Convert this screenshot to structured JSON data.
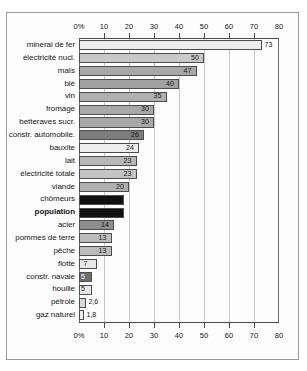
{
  "chart_data": {
    "type": "bar",
    "orientation": "horizontal",
    "title": "",
    "xlabel": "",
    "ylabel": "",
    "xlim": [
      0,
      80
    ],
    "xticks": [
      0,
      10,
      20,
      30,
      40,
      50,
      60,
      70,
      80
    ],
    "xtick_labels": [
      "0%",
      "10",
      "20",
      "30",
      "40",
      "50",
      "60",
      "70",
      "80"
    ],
    "grid": true,
    "grid_axis": "x",
    "axis_positions": [
      "top",
      "bottom"
    ],
    "legend": null,
    "categories": [
      "minerai de fer",
      "électricité nucl.",
      "maïs",
      "blé",
      "vin",
      "fromage",
      "betteraves sucr.",
      "constr. automobile.",
      "bauxite",
      "lait",
      "électricité totale",
      "viande",
      "chômeurs",
      "population",
      "acier",
      "pommes de terre",
      "pêche",
      "flotte",
      "constr. navale",
      "houille",
      "pétrole",
      "gaz naturel"
    ],
    "values": [
      73,
      50,
      47,
      40,
      35,
      30,
      30,
      26,
      24,
      23,
      23,
      20,
      18,
      18,
      14,
      13,
      13,
      7,
      5,
      5,
      2.6,
      1.8
    ],
    "value_labels": [
      "73",
      "50",
      "47",
      "40",
      "35",
      "30",
      "30",
      "26",
      "24",
      "23",
      "23",
      "20",
      "",
      "",
      "14",
      "13",
      "13",
      "7",
      "5",
      "5",
      "2,6",
      "1,8"
    ],
    "bar_colors": [
      "#ededed",
      "#c9c9c9",
      "#a8a8a8",
      "#a0a0a0",
      "#b0b0b0",
      "#a8a8a8",
      "#a8a8a8",
      "#7d7d7d",
      "#efefef",
      "#b8b8b8",
      "#c4c4c4",
      "#b0b0b0",
      "#101010",
      "#101010",
      "#8e8e8e",
      "#bdbdbd",
      "#bdbdbd",
      "#e8e8e8",
      "#6e6e6e",
      "#e8e8e8",
      "#d6d6d6",
      "#ededed"
    ],
    "label_placement": [
      "outside",
      "inside",
      "inside",
      "inside",
      "inside",
      "inside",
      "inside",
      "inside",
      "inside",
      "inside",
      "inside",
      "inside",
      "inverted",
      "inverted",
      "inside",
      "inside",
      "inside",
      "inside",
      "inverted",
      "inside",
      "outside",
      "outside"
    ],
    "emphasized_categories": [
      "population"
    ]
  }
}
